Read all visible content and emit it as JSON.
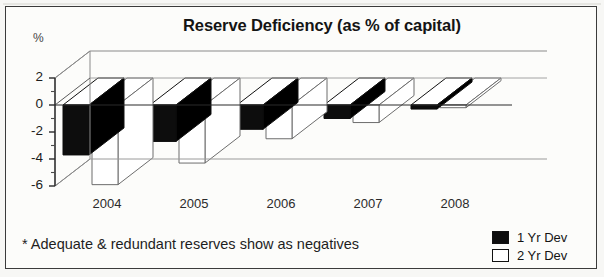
{
  "chart_data": {
    "type": "bar",
    "title": "Reserve Deficiency (as % of capital)",
    "xlabel": "",
    "ylabel": "%",
    "categories": [
      "2004",
      "2005",
      "2006",
      "2007",
      "2008"
    ],
    "series": [
      {
        "name": "1 Yr Dev",
        "values": [
          -3.7,
          -2.7,
          -1.8,
          -1.0,
          -0.3
        ],
        "color": "#0d0d0d"
      },
      {
        "name": "2 Yr Dev",
        "values": [
          -5.9,
          -4.3,
          -2.5,
          -1.3,
          -0.2
        ],
        "color": "#ffffff"
      }
    ],
    "ylim": [
      -6,
      2
    ],
    "yticks": [
      2,
      0,
      -2,
      -4,
      -6
    ],
    "ytick_labels": [
      "2",
      "0",
      "-2",
      "-4",
      "-6"
    ],
    "minor_ticks": [
      1,
      -1,
      -3,
      -5
    ],
    "grid": false,
    "legend_position": "bottom-right",
    "style": "3d-bar",
    "annotation": "* Adequate & redundant reserves show as negatives"
  },
  "chart": {
    "title": "Reserve Deficiency (as % of capital)",
    "axis_caption": "%",
    "footnote": "* Adequate & redundant reserves show as negatives"
  },
  "legend": {
    "items": [
      {
        "label": "1 Yr Dev",
        "swatch": "black"
      },
      {
        "label": "2 Yr Dev",
        "swatch": "white"
      }
    ]
  }
}
